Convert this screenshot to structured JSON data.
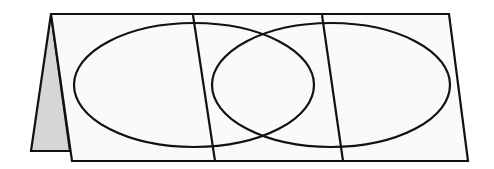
{
  "diagram": {
    "type": "folded-venn-diagram",
    "colors": {
      "paper": "#fafafa",
      "back_flap": "#d6d6d6",
      "line": "#111111",
      "background": "#ffffff"
    },
    "back_flap": {
      "points": "51,14 31,151 70,151"
    },
    "front_panel": {
      "points": "51,14 449,14 468,161 72,161"
    },
    "fold_lines": [
      {
        "x1": 193,
        "y1": 15,
        "x2": 215,
        "y2": 161
      },
      {
        "x1": 322,
        "y1": 15,
        "x2": 343,
        "y2": 161
      }
    ],
    "ellipses": [
      {
        "name": "left-circle",
        "cx": 194,
        "cy": 85,
        "rx": 120,
        "ry": 62
      },
      {
        "name": "right-circle",
        "cx": 331,
        "cy": 85,
        "rx": 119,
        "ry": 62
      }
    ],
    "labels": []
  }
}
